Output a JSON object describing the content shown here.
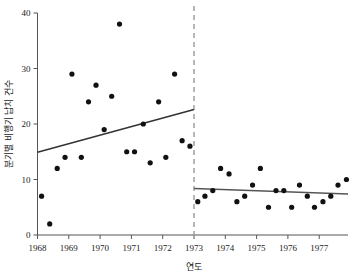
{
  "chart_data": {
    "type": "scatter",
    "title": "",
    "xlabel": "연도",
    "ylabel": "분기별 비행기 납치 건수",
    "xlim": [
      1968.0,
      1977.92
    ],
    "ylim": [
      0,
      40
    ],
    "xticks": [
      1968,
      1969,
      1970,
      1971,
      1972,
      1973,
      1974,
      1975,
      1976,
      1977
    ],
    "xtick_labels": [
      "1968",
      "1969",
      "1970",
      "1971",
      "1972",
      "1973",
      "1974",
      "1975",
      "1976",
      "1977"
    ],
    "yticks": [
      0,
      10,
      20,
      30,
      40
    ],
    "ytick_labels": [
      "0",
      "10",
      "20",
      "30",
      "40"
    ],
    "grid": false,
    "legend": "none",
    "marker_color": "#111111",
    "line_color": "#333333",
    "line_color_right": "#555555",
    "vline_color": "#999999",
    "axis_color": "#555555",
    "annotations": [
      {
        "name": "intervention-line",
        "type": "vertical-dashed",
        "x": 1973.0,
        "label": ""
      }
    ],
    "series": [
      {
        "name": "pre-intervention-hijackings",
        "points": [
          {
            "x": 1968.13,
            "y": 7
          },
          {
            "x": 1968.39,
            "y": 2
          },
          {
            "x": 1968.63,
            "y": 12
          },
          {
            "x": 1968.88,
            "y": 14
          },
          {
            "x": 1969.1,
            "y": 29
          },
          {
            "x": 1969.4,
            "y": 14
          },
          {
            "x": 1969.63,
            "y": 24
          },
          {
            "x": 1969.87,
            "y": 27
          },
          {
            "x": 1970.13,
            "y": 19
          },
          {
            "x": 1970.37,
            "y": 25
          },
          {
            "x": 1970.62,
            "y": 38
          },
          {
            "x": 1970.85,
            "y": 15
          },
          {
            "x": 1971.1,
            "y": 15
          },
          {
            "x": 1971.38,
            "y": 20
          },
          {
            "x": 1971.6,
            "y": 13
          },
          {
            "x": 1971.87,
            "y": 24
          },
          {
            "x": 1972.1,
            "y": 14
          },
          {
            "x": 1972.38,
            "y": 29
          },
          {
            "x": 1972.62,
            "y": 17
          },
          {
            "x": 1972.87,
            "y": 16
          }
        ]
      },
      {
        "name": "post-intervention-hijackings",
        "points": [
          {
            "x": 1973.12,
            "y": 6
          },
          {
            "x": 1973.35,
            "y": 7
          },
          {
            "x": 1973.6,
            "y": 8
          },
          {
            "x": 1973.85,
            "y": 12
          },
          {
            "x": 1974.12,
            "y": 11
          },
          {
            "x": 1974.37,
            "y": 6
          },
          {
            "x": 1974.62,
            "y": 7
          },
          {
            "x": 1974.87,
            "y": 9
          },
          {
            "x": 1975.12,
            "y": 12
          },
          {
            "x": 1975.38,
            "y": 5
          },
          {
            "x": 1975.62,
            "y": 8
          },
          {
            "x": 1975.87,
            "y": 8
          },
          {
            "x": 1976.12,
            "y": 5
          },
          {
            "x": 1976.37,
            "y": 9
          },
          {
            "x": 1976.62,
            "y": 7
          },
          {
            "x": 1976.85,
            "y": 5
          },
          {
            "x": 1977.12,
            "y": 6
          },
          {
            "x": 1977.37,
            "y": 7
          },
          {
            "x": 1977.6,
            "y": 9
          },
          {
            "x": 1977.87,
            "y": 10
          }
        ]
      }
    ],
    "trend_lines": [
      {
        "name": "pre-intervention-trend",
        "x0": 1968.0,
        "y0": 14.9,
        "x1": 1973.0,
        "y1": 22.6
      },
      {
        "name": "post-intervention-trend",
        "x0": 1973.0,
        "y0": 8.4,
        "x1": 1977.92,
        "y1": 7.4
      }
    ]
  }
}
